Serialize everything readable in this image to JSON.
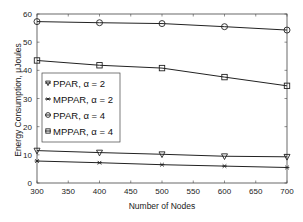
{
  "chart_data": {
    "type": "line",
    "title": "",
    "xlabel": "Number of Nodes",
    "ylabel": "Energy Consumption, μJoules",
    "x": [
      300,
      400,
      500,
      600,
      700
    ],
    "xlim": [
      300,
      700
    ],
    "ylim": [
      0,
      60
    ],
    "xticks": [
      "300",
      "350",
      "400",
      "450",
      "500",
      "550",
      "600",
      "650",
      "700"
    ],
    "yticks": [
      "0",
      "10",
      "20",
      "30",
      "40",
      "50",
      "60"
    ],
    "grid": false,
    "legend_position": "center-left",
    "series": [
      {
        "name": "PPAR, α = 2",
        "marker": "triangle-down",
        "values": [
          11.5,
          10.8,
          10.2,
          9.5,
          9.3
        ]
      },
      {
        "name": "MPPAR, α = 2",
        "marker": "star",
        "values": [
          7.8,
          7.2,
          6.5,
          6.0,
          5.5
        ]
      },
      {
        "name": "PPAR, α = 4",
        "marker": "circle",
        "values": [
          57.3,
          56.9,
          56.6,
          55.5,
          54.3
        ]
      },
      {
        "name": "MPPAR, α = 4",
        "marker": "square",
        "values": [
          43.5,
          41.8,
          40.8,
          37.6,
          34.5
        ]
      }
    ]
  }
}
